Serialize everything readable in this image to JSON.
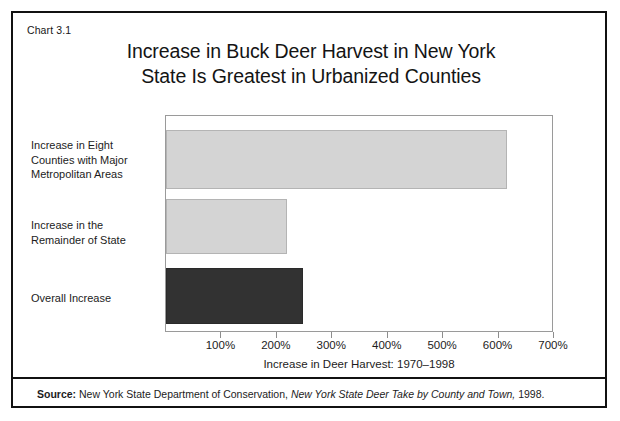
{
  "figure": {
    "number_label": "Chart 3.1",
    "title_line1": "Increase in Buck Deer Harvest in New York",
    "title_line2": "State Is Greatest in Urbanized Counties"
  },
  "source": {
    "label": "Source:",
    "agency": "New York State Department of Conservation,",
    "publication": "New York State Deer Take by County and Town,",
    "year": "1998."
  },
  "colors": {
    "bar_light": "#d4d4d4",
    "bar_light_border": "#b4b4b4",
    "bar_dark": "#323232",
    "bar_dark_border": "#2a2a2a",
    "frame": "#111111",
    "plot_border": "#9a9a9a",
    "text": "#1c1c1c"
  },
  "chart_data": {
    "type": "bar",
    "orientation": "horizontal",
    "title": "Increase in Buck Deer Harvest in New York State Is Greatest in Urbanized Counties",
    "subtitle": "",
    "xlabel": "Increase in Deer Harvest: 1970–1998",
    "ylabel": "",
    "xlim": [
      0,
      700
    ],
    "ylim": null,
    "grid": false,
    "legend": null,
    "tick_labels": [
      "100%",
      "200%",
      "300%",
      "400%",
      "500%",
      "600%",
      "700%"
    ],
    "tick_values": [
      100,
      200,
      300,
      400,
      500,
      600,
      700
    ],
    "categories": [
      "Increase in Eight Counties with Major Metropolitan Areas",
      "Increase in the Remainder of State",
      "Overall Increase"
    ],
    "category_lines": [
      [
        "Increase in Eight",
        "Counties with Major",
        "Metropolitan Areas"
      ],
      [
        "Increase in the",
        "Remainder of State"
      ],
      [
        "Overall Increase"
      ]
    ],
    "values": [
      615,
      218,
      247
    ],
    "value_unit": "%",
    "bar_colors": [
      "#d4d4d4",
      "#d4d4d4",
      "#323232"
    ]
  }
}
